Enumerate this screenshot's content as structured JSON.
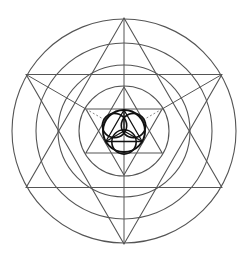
{
  "diagram": {
    "center": [
      124,
      131
    ],
    "colors": {
      "line": "#555555",
      "bold": "#111111",
      "dashed": "#888888",
      "background": "#ffffff"
    },
    "circles": [
      {
        "name": "outer-circle",
        "r": 112
      },
      {
        "name": "second-circle",
        "r": 88
      },
      {
        "name": "third-circle",
        "r": 66
      },
      {
        "name": "fourth-circle",
        "r": 45
      }
    ],
    "hexagrams": [
      {
        "name": "large-hexagram",
        "r": 113
      },
      {
        "name": "small-hexagram",
        "r": 44
      }
    ],
    "center_circle": {
      "r": 21
    },
    "axis": {
      "name": "vertical-axis"
    }
  }
}
